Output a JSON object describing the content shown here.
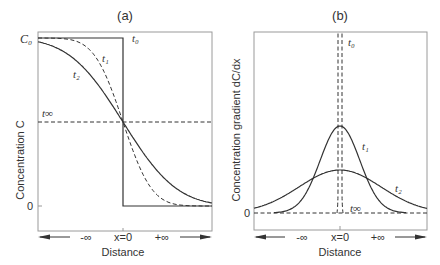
{
  "chart_data": [
    {
      "type": "line",
      "title": "(a)",
      "xlabel": "Distance",
      "ylabel": "Concentration C",
      "y_ticks": [
        "C₀",
        "0"
      ],
      "x_labels": {
        "left": "-∞",
        "center": "x=0",
        "right": "+∞"
      },
      "series": [
        {
          "name": "t₀",
          "style": "solid",
          "shape": "step"
        },
        {
          "name": "t₁",
          "style": "dashed",
          "shape": "erfc"
        },
        {
          "name": "t₂",
          "style": "solid",
          "shape": "erfc-wide"
        },
        {
          "name": "t∞",
          "style": "dashed",
          "shape": "constant",
          "value": 0.5
        }
      ]
    },
    {
      "type": "line",
      "title": "(b)",
      "xlabel": "Distance",
      "ylabel": "Concentration gradient dC/dx",
      "y_ticks": [
        "0"
      ],
      "x_labels": {
        "left": "-∞",
        "center": "x=0",
        "right": "+∞"
      },
      "series": [
        {
          "name": "t₀",
          "style": "dashed",
          "shape": "spike"
        },
        {
          "name": "t₁",
          "style": "solid",
          "shape": "gaussian"
        },
        {
          "name": "t₂",
          "style": "solid",
          "shape": "gaussian-wide"
        },
        {
          "name": "t∞",
          "style": "dashed",
          "shape": "constant",
          "value": 0
        }
      ]
    }
  ]
}
